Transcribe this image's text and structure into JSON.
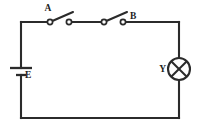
{
  "figure": {
    "kind": "electrical-circuit-schematic",
    "background_color": "#ffffff",
    "line_color": "#2b2b2b",
    "width": 199,
    "height": 132
  },
  "labels": {
    "switch_a": "A",
    "switch_b": "B",
    "battery": "E",
    "lamp": "Y"
  },
  "components": {
    "battery": {
      "name": "battery",
      "label": "E",
      "state": "source",
      "position": "left-branch"
    },
    "switch_a": {
      "name": "switch-a",
      "label": "A",
      "state": "open",
      "position": "top-branch-left"
    },
    "switch_b": {
      "name": "switch-b",
      "label": "B",
      "state": "open",
      "position": "top-branch-right"
    },
    "lamp": {
      "name": "lamp",
      "label": "Y",
      "state": "off",
      "position": "right-branch"
    }
  },
  "geometry": {
    "loop": {
      "left_x": 21,
      "right_x": 179,
      "top_y": 22,
      "bottom_y": 118
    },
    "battery": {
      "long_plate_y": 68,
      "short_plate_y": 75,
      "long_plate_half_width": 11,
      "short_plate_half_width": 5,
      "label_x": 25,
      "label_y": 78
    },
    "switch_a": {
      "left_terminal_x": 50,
      "right_terminal_x": 69,
      "terminal_y": 22,
      "terminal_r": 2.6,
      "blade_tip_x": 73,
      "blade_tip_y": 12,
      "label_x": 48,
      "label_y": 11
    },
    "switch_b": {
      "left_terminal_x": 104,
      "right_terminal_x": 123,
      "terminal_y": 22,
      "terminal_r": 2.6,
      "blade_tip_x": 127,
      "blade_tip_y": 12,
      "label_x": 127,
      "label_y": 19
    },
    "lamp": {
      "center_x": 179,
      "center_y": 69,
      "radius": 11,
      "label_x": 160,
      "label_y": 72
    }
  }
}
